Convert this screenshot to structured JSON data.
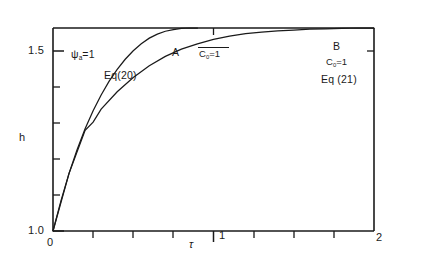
{
  "chart_data": {
    "type": "line",
    "title": "",
    "xlabel": "τ",
    "ylabel": "h",
    "xlim": [
      0,
      2
    ],
    "ylim": [
      1.0,
      1.5
    ],
    "xticks": [
      0,
      1,
      2
    ],
    "xticklabels": [
      "0",
      "1",
      "2"
    ],
    "xminorticks": [
      0.25,
      0.5,
      0.75,
      1.25,
      1.5,
      1.75
    ],
    "yticks": [
      1.0,
      1.5
    ],
    "yticklabels": [
      "1.0",
      "1.5"
    ],
    "yminorticks": [
      1.1,
      1.2,
      1.3,
      1.4
    ],
    "grid": false,
    "legend": "none",
    "series": [
      {
        "name": "A",
        "label": "Eq(20)",
        "annotation": "C₀=1",
        "x": [
          0.0,
          0.05,
          0.1,
          0.15,
          0.2,
          0.25,
          0.3,
          0.35,
          0.4,
          0.45,
          0.5,
          0.55,
          0.6,
          0.65,
          0.7,
          0.75,
          0.8,
          0.85,
          0.9
        ],
        "y": [
          1.0,
          1.075,
          1.142,
          1.2,
          1.252,
          1.296,
          1.335,
          1.369,
          1.398,
          1.423,
          1.444,
          1.461,
          1.475,
          1.485,
          1.492,
          1.496,
          1.499,
          1.5,
          1.5
        ]
      },
      {
        "name": "B",
        "label": "Eq (21)",
        "annotation": "C₀=1",
        "x": [
          0.0,
          0.1,
          0.2,
          0.25,
          0.3,
          0.4,
          0.5,
          0.6,
          0.7,
          0.8,
          0.9,
          1.0,
          1.1,
          1.2,
          1.3,
          1.4,
          1.5,
          1.6,
          1.7,
          1.8,
          1.9,
          2.0
        ],
        "y": [
          1.0,
          1.142,
          1.248,
          1.268,
          1.3,
          1.343,
          1.378,
          1.407,
          1.43,
          1.448,
          1.461,
          1.472,
          1.48,
          1.486,
          1.49,
          1.493,
          1.495,
          1.497,
          1.498,
          1.499,
          1.5,
          1.5
        ]
      }
    ],
    "annotations": [
      {
        "name": "psi-condition",
        "text": "ψₐ=1"
      },
      {
        "name": "curve-a-letter",
        "text": "A"
      },
      {
        "name": "curve-a-c0",
        "text": "C₀=1"
      },
      {
        "name": "curve-a-eq",
        "text": "Eq(20)"
      },
      {
        "name": "curve-b-letter",
        "text": "B"
      },
      {
        "name": "curve-b-c0",
        "text": "C₀=1"
      },
      {
        "name": "curve-b-eq",
        "text": "Eq (21)"
      }
    ]
  },
  "axes": {
    "y_label": "h",
    "x_label": "τ",
    "y_top_label": "1.5",
    "y_bottom_label": "1.0",
    "x_origin_label": "0",
    "x_mid_label": "1",
    "x_end_label": "2"
  },
  "labels": {
    "psi": "ψ",
    "psi_sub": "a",
    "psi_eq": "=1",
    "curve_a": "A",
    "curve_b": "B",
    "c_sym": "C",
    "c_sub": "0",
    "c_eq": "=1",
    "eq20": "Eq(20)",
    "eq21": "Eq (21)"
  },
  "colors": {
    "ink": "#1a1a1a",
    "background": "#ffffff"
  }
}
